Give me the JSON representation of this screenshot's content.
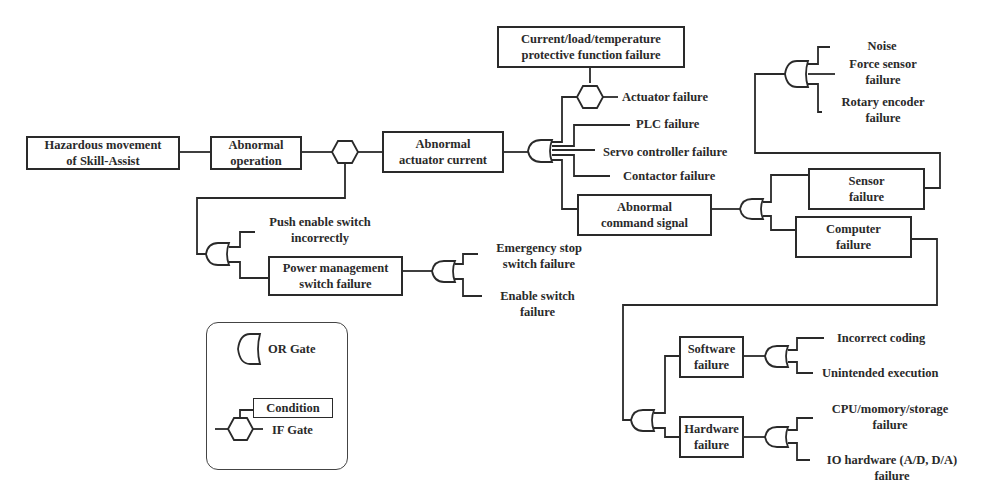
{
  "diagram": {
    "type": "fault-tree",
    "top_event": "Hazardous movement of Skill-Assist",
    "nodes": {
      "hazard": {
        "line1": "Hazardous movement",
        "line2": "of Skill-Assist"
      },
      "abnormal_operation": {
        "line1": "Abnormal",
        "line2": "operation"
      },
      "abnormal_actuator_current": {
        "line1": "Abnormal",
        "line2": "actuator current"
      },
      "protective_condition": {
        "line1": "Current/load/temperature",
        "line2": "protective function failure"
      },
      "actuator_failure": "Actuator failure",
      "plc_failure": "PLC failure",
      "servo_controller_failure": "Servo controller failure",
      "contactor_failure": "Contactor failure",
      "abnormal_command_signal": {
        "line1": "Abnormal",
        "line2": "command signal"
      },
      "sensor_failure": {
        "line1": "Sensor",
        "line2": "failure"
      },
      "computer_failure": {
        "line1": "Computer",
        "line2": "failure"
      },
      "noise": "Noise",
      "force_sensor_failure": {
        "line1": "Force sensor",
        "line2": "failure"
      },
      "rotary_encoder_failure": {
        "line1": "Rotary encoder",
        "line2": "failure"
      },
      "push_enable_switch": {
        "line1": "Push enable switch",
        "line2": "incorrectly"
      },
      "power_management_switch": {
        "line1": "Power management",
        "line2": "switch failure"
      },
      "emergency_stop_switch": {
        "line1": "Emergency stop",
        "line2": "switch failure"
      },
      "enable_switch": {
        "line1": "Enable switch",
        "line2": "failure"
      },
      "software_failure": {
        "line1": "Software",
        "line2": "failure"
      },
      "hardware_failure": {
        "line1": "Hardware",
        "line2": "failure"
      },
      "incorrect_coding": "Incorrect coding",
      "unintended_execution": "Unintended execution",
      "cpu_memory_storage": {
        "line1": "CPU/momory/storage",
        "line2": "failure"
      },
      "io_hardware": {
        "line1": "IO hardware (A/D, D/A)",
        "line2": "failure"
      }
    },
    "legend": {
      "or_gate": "OR Gate",
      "condition": "Condition",
      "if_gate": "IF Gate"
    },
    "colors": {
      "stroke": "#2a2a2a",
      "background": "#ffffff"
    }
  }
}
